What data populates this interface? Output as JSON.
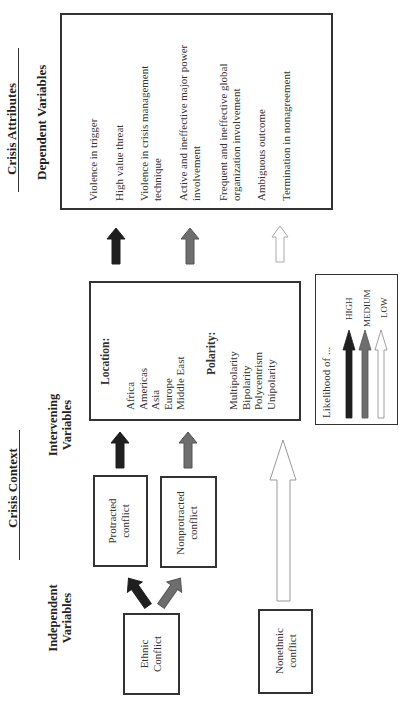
{
  "headers": {
    "crisis_attributes": "Crisis Attributes",
    "dependent_variables": "Dependent Variables",
    "crisis_context": "Crisis Context",
    "intervening_variables_1": "Intervening",
    "intervening_variables_2": "Variables",
    "independent_variables_1": "Independent",
    "independent_variables_2": "Variables"
  },
  "dependent_box": {
    "items": [
      {
        "line1": "Violence in trigger",
        "line2": ""
      },
      {
        "line1": "High value threat",
        "line2": ""
      },
      {
        "line1": "Violence in crisis management",
        "line2": "technique"
      },
      {
        "line1": "Active and ineffective major power",
        "line2": "involvement"
      },
      {
        "line1": "Frequent and ineffective global",
        "line2": "organization involvement"
      },
      {
        "line1": "Ambiguous outcome",
        "line2": ""
      },
      {
        "line1": "Termination in nonagreement",
        "line2": ""
      }
    ]
  },
  "intervening_box": {
    "location_title": "Location:",
    "locations": [
      "Africa",
      "Americas",
      "Asia",
      "Europe",
      "Middle East"
    ],
    "polarity_title": "Polarity:",
    "polarities": [
      "Multipolarity",
      "Bipolarity",
      "Polycentrism",
      "Unipolarity"
    ]
  },
  "legend": {
    "title": "Likelihood of ...",
    "items": [
      {
        "label": "HIGH",
        "color": "#1f1f1f"
      },
      {
        "label": "MEDIUM",
        "color": "#6e6e6e"
      },
      {
        "label": "LOW",
        "color": "#ffffff"
      }
    ]
  },
  "context_boxes": {
    "protracted_1": "Protracted",
    "protracted_2": "conflict",
    "nonprotracted_1": "Nonprotracted",
    "nonprotracted_2": "conflict"
  },
  "independent_boxes": {
    "ethnic_1": "Ethnic",
    "ethnic_2": "Conflict",
    "nonethnic_1": "Nonethnic",
    "nonethnic_2": "conflict"
  },
  "colors": {
    "high": "#1f1f1f",
    "medium": "#6e6e6e",
    "low": "#ffffff",
    "border": "#333333"
  }
}
